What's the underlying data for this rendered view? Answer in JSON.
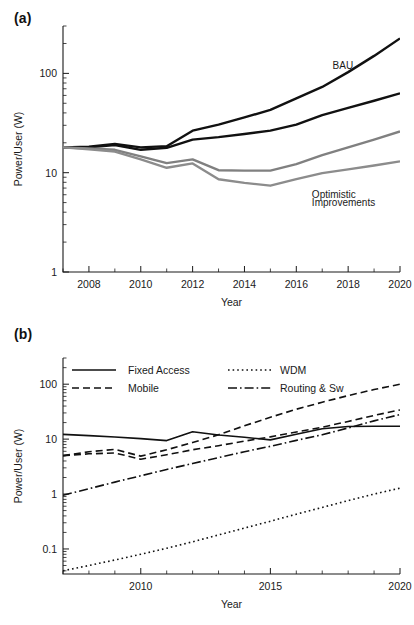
{
  "figure": {
    "panels": [
      {
        "tag": "(a)"
      },
      {
        "tag": "(b)"
      }
    ]
  },
  "chart_data": [
    {
      "panel": "(a)",
      "type": "line",
      "title": "",
      "xlabel": "Year",
      "ylabel": "Power/User (W)",
      "yscale": "log",
      "ylim": [
        1,
        300
      ],
      "xlim": [
        2007,
        2020
      ],
      "ytick_labels": [
        "1",
        "10",
        "100"
      ],
      "ytick_values": [
        1,
        10,
        100
      ],
      "xtick_labels": [
        "2008",
        "2010",
        "2012",
        "2014",
        "2016",
        "2018",
        "2020"
      ],
      "xtick_values": [
        2008,
        2010,
        2012,
        2014,
        2016,
        2018,
        2020
      ],
      "grid": false,
      "legend": "none",
      "annotations": [
        {
          "text": "BAU",
          "x": 2017.4,
          "y": 110
        },
        {
          "text": "Optimistic",
          "x": 2016.6,
          "y": 5.6
        },
        {
          "text": "Improvements",
          "x": 2016.6,
          "y": 4.6
        }
      ],
      "x": [
        2007,
        2008,
        2009,
        2010,
        2011,
        2012,
        2013,
        2014,
        2015,
        2016,
        2017,
        2018,
        2019,
        2020
      ],
      "series": [
        {
          "name": "BAU upper",
          "color": "#111111",
          "width": 2.4,
          "dash": "none",
          "values": [
            18.0,
            18.3,
            19.5,
            18.0,
            18.5,
            26.5,
            30.5,
            36.0,
            43.0,
            56.0,
            73.0,
            103.0,
            150.0,
            225.0
          ]
        },
        {
          "name": "BAU lower",
          "color": "#111111",
          "width": 2.4,
          "dash": "none",
          "values": [
            18.0,
            18.0,
            19.0,
            17.0,
            17.8,
            21.5,
            22.8,
            24.5,
            26.5,
            30.5,
            38.0,
            45.0,
            53.0,
            63.0
          ]
        },
        {
          "name": "Optimistic upper",
          "color": "#808080",
          "width": 2.4,
          "dash": "none",
          "values": [
            18.0,
            17.5,
            17.0,
            14.6,
            12.5,
            13.6,
            10.6,
            10.5,
            10.5,
            12.2,
            15.0,
            18.0,
            21.5,
            26.0
          ]
        },
        {
          "name": "Optimistic lower",
          "color": "#8c8c8c",
          "width": 2.4,
          "dash": "none",
          "values": [
            18.0,
            17.2,
            16.3,
            13.6,
            11.2,
            12.4,
            8.6,
            7.9,
            7.4,
            8.6,
            9.9,
            10.8,
            11.8,
            13.0
          ]
        }
      ]
    },
    {
      "panel": "(b)",
      "type": "line",
      "title": "",
      "xlabel": "Year",
      "ylabel": "Power/User (W)",
      "yscale": "log",
      "ylim": [
        0.035,
        300
      ],
      "xlim": [
        2007,
        2020
      ],
      "ytick_labels": [
        "0.1",
        "1",
        "10",
        "100"
      ],
      "ytick_values": [
        0.1,
        1,
        10,
        100
      ],
      "xtick_labels": [
        "2010",
        "2015",
        "2020"
      ],
      "xtick_values": [
        2010,
        2015,
        2020
      ],
      "grid": false,
      "legend": "upper-left-inside",
      "x": [
        2007,
        2008,
        2009,
        2010,
        2011,
        2012,
        2013,
        2014,
        2015,
        2016,
        2017,
        2018,
        2019,
        2020
      ],
      "series": [
        {
          "name": "Fixed Access",
          "color": "#111111",
          "width": 1.6,
          "dash": "none",
          "values": [
            12.2,
            11.6,
            10.9,
            10.2,
            9.4,
            13.6,
            11.9,
            10.8,
            9.7,
            12.3,
            15.4,
            17.0,
            17.2,
            17.2
          ]
        },
        {
          "name": "Mobile upper",
          "color": "#111111",
          "width": 1.6,
          "dash": "7,4",
          "values": [
            5.0,
            5.9,
            6.5,
            4.9,
            6.4,
            8.7,
            12.0,
            17.5,
            25.0,
            35.0,
            47.0,
            62.0,
            80.0,
            100.0
          ]
        },
        {
          "name": "Mobile lower",
          "color": "#111111",
          "width": 1.6,
          "dash": "7,4",
          "values": [
            5.0,
            5.4,
            5.6,
            4.3,
            5.2,
            6.4,
            7.6,
            9.2,
            11.0,
            13.5,
            16.5,
            21.0,
            27.0,
            34.0
          ]
        },
        {
          "name": "WDM",
          "color": "#111111",
          "width": 1.6,
          "dash": "1.6,3",
          "values": [
            0.04,
            0.05,
            0.063,
            0.08,
            0.103,
            0.135,
            0.18,
            0.24,
            0.32,
            0.43,
            0.57,
            0.76,
            1.0,
            1.28
          ]
        },
        {
          "name": "Routing & Sw",
          "color": "#111111",
          "width": 1.6,
          "dash": "9,3,1.6,3",
          "values": [
            0.95,
            1.25,
            1.65,
            2.15,
            2.8,
            3.6,
            4.6,
            5.9,
            7.4,
            9.5,
            12.0,
            16.0,
            21.5,
            28.0
          ]
        }
      ],
      "legend_entries": [
        {
          "label": "Fixed Access",
          "dash": "none"
        },
        {
          "label": "Mobile",
          "dash": "7,4"
        },
        {
          "label": "WDM",
          "dash": "1.6,3"
        },
        {
          "label": "Routing & Sw",
          "dash": "9,3,1.6,3"
        }
      ]
    }
  ]
}
